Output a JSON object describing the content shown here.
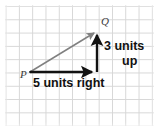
{
  "figure": {
    "kind": "coordinate-grid-vector-diagram",
    "width": 159,
    "height": 131,
    "background_color": "#ffffff",
    "grid": {
      "line_color": "#d6d6d6",
      "cell_size_px": 13.3,
      "visible": true
    },
    "points": [
      {
        "id": "P",
        "label": "P",
        "x_px": 30,
        "y_px": 72,
        "label_style": "italic-serif"
      },
      {
        "id": "Q",
        "label": "Q",
        "x_px": 97,
        "y_px": 31,
        "label_style": "italic-serif"
      }
    ],
    "arrows": [
      {
        "id": "horizontal-run",
        "from": "P",
        "to_px": {
          "x": 97,
          "y": 72
        },
        "color": "#111111",
        "label": "5 units right",
        "units": 5,
        "direction": "right"
      },
      {
        "id": "vertical-rise",
        "from_px": {
          "x": 97,
          "y": 72
        },
        "to_px": {
          "x": 97,
          "y": 31
        },
        "color": "#111111",
        "label_line_1": "3 units",
        "label_line_2": "up",
        "units": 3,
        "direction": "up"
      },
      {
        "id": "resultant-PQ",
        "from": "P",
        "to": "Q",
        "color": "#808080",
        "label": ""
      }
    ],
    "labels": {
      "point_p": "P",
      "point_q": "Q",
      "run_text": "5 units right",
      "rise_text_line1": "3 units",
      "rise_text_line2": "up"
    },
    "colors": {
      "grid": "#d6d6d6",
      "black_arrow": "#111111",
      "gray_arrow": "#808080",
      "point_label": "#3a3a3a",
      "measure_text": "#111111",
      "background": "#ffffff"
    }
  }
}
